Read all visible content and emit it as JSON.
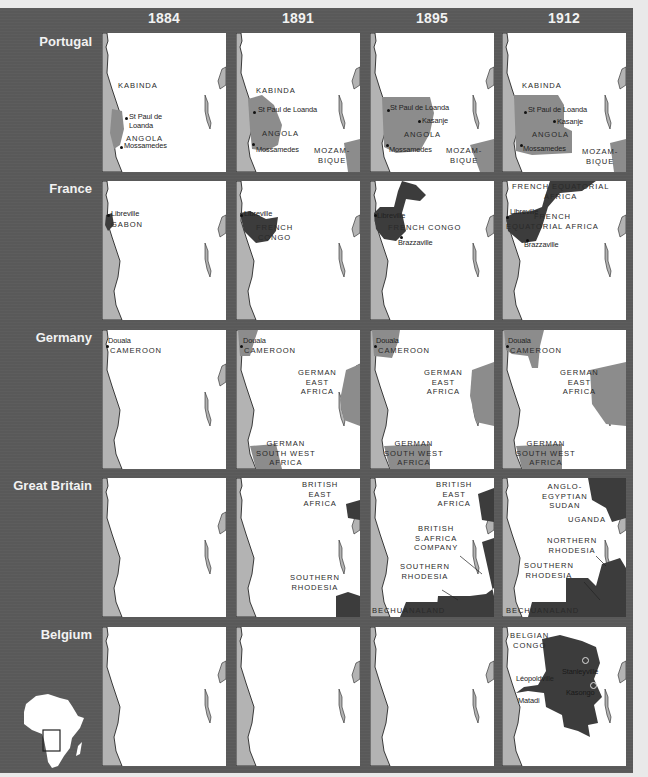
{
  "years": [
    "1884",
    "1891",
    "1895",
    "1912"
  ],
  "colors": {
    "background": "#595959",
    "land": "#b3b3b3",
    "territory_medium": "#8c8c8c",
    "territory_dark": "#3c3c3c",
    "sea": "#ffffff"
  },
  "rows": [
    {
      "power": "Portugal",
      "panels": [
        {
          "year": "1884",
          "labels": [
            "KABINDA",
            "ANGOLA"
          ],
          "cities": [
            "St Paul de\nLoanda",
            "Mossamedes"
          ]
        },
        {
          "year": "1891",
          "labels": [
            "KABINDA",
            "ANGOLA",
            "MOZAM-\nBIQUE"
          ],
          "cities": [
            "St Paul de Loanda",
            "Mossamedes"
          ]
        },
        {
          "year": "1895",
          "labels": [
            "ANGOLA",
            "MOZAM-\nBIQUE"
          ],
          "cities": [
            "St Paul de Loanda",
            "Kasanje",
            "Mossamedes"
          ]
        },
        {
          "year": "1912",
          "labels": [
            "KABINDA",
            "ANGOLA",
            "MOZAM-\nBIQUE"
          ],
          "cities": [
            "St Paul de Loanda",
            "Kasanje",
            "Mossamedes"
          ]
        }
      ]
    },
    {
      "power": "France",
      "panels": [
        {
          "year": "1884",
          "labels": [
            "GABON"
          ],
          "cities": [
            "Libreville"
          ]
        },
        {
          "year": "1891",
          "labels": [
            "FRENCH\nCONGO"
          ],
          "cities": [
            "Libreville"
          ]
        },
        {
          "year": "1895",
          "labels": [
            "FRENCH CONGO"
          ],
          "cities": [
            "Libreville",
            "Brazzaville"
          ]
        },
        {
          "year": "1912",
          "labels": [
            "FRENCH EQUATORIAL\nAFRICA",
            "FRENCH\nEQUATORIAL AFRICA"
          ],
          "cities": [
            "Libreville",
            "Brazzaville"
          ]
        }
      ]
    },
    {
      "power": "Germany",
      "panels": [
        {
          "year": "1884",
          "labels": [
            "CAMEROON"
          ],
          "cities": [
            "Douala"
          ]
        },
        {
          "year": "1891",
          "labels": [
            "CAMEROON",
            "GERMAN\nEAST\nAFRICA",
            "GERMAN\nSOUTH WEST\nAFRICA"
          ],
          "cities": [
            "Douala"
          ]
        },
        {
          "year": "1895",
          "labels": [
            "CAMEROON",
            "GERMAN\nEAST\nAFRICA",
            "GERMAN\nSOUTH WEST\nAFRICA"
          ],
          "cities": [
            "Douala"
          ]
        },
        {
          "year": "1912",
          "labels": [
            "CAMEROON",
            "GERMAN\nEAST\nAFRICA",
            "GERMAN\nSOUTH WEST\nAFRICA"
          ],
          "cities": [
            "Douala"
          ]
        }
      ]
    },
    {
      "power": "Great Britain",
      "panels": [
        {
          "year": "1884",
          "labels": [],
          "cities": []
        },
        {
          "year": "1891",
          "labels": [
            "BRITISH\nEAST\nAFRICA",
            "SOUTHERN\nRHODESIA"
          ],
          "cities": []
        },
        {
          "year": "1895",
          "labels": [
            "BRITISH\nEAST\nAFRICA",
            "BRITISH\nS.AFRICA\nCOMPANY",
            "SOUTHERN\nRHODESIA",
            "BECHUANALAND"
          ],
          "cities": []
        },
        {
          "year": "1912",
          "labels": [
            "ANGLO-\nEGYPTIAN\nSUDAN",
            "UGANDA",
            "NORTHERN\nRHODESIA",
            "SOUTHERN\nRHODESIA",
            "BECHUANALAND"
          ],
          "cities": []
        }
      ]
    },
    {
      "power": "Belgium",
      "panels": [
        {
          "year": "1884",
          "labels": [],
          "cities": []
        },
        {
          "year": "1891",
          "labels": [],
          "cities": []
        },
        {
          "year": "1895",
          "labels": [],
          "cities": []
        },
        {
          "year": "1912",
          "labels": [
            "BELGIAN\nCONGO"
          ],
          "cities": [
            "Stanleyville",
            "Léopoldville",
            "Kasongo",
            "Matadi"
          ]
        }
      ]
    }
  ],
  "inset": {
    "icon": "africa-locator-icon",
    "description": "Africa outline with highlighted region box"
  }
}
